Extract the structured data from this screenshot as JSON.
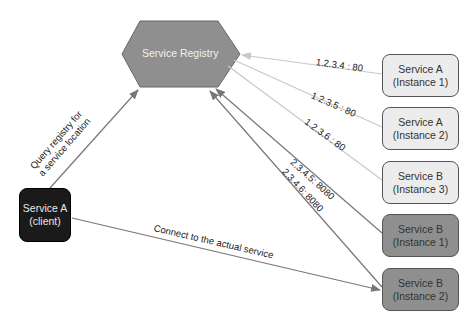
{
  "registry": {
    "label": "Service Registry",
    "fill": "#8f8f8f"
  },
  "client": {
    "line1": "Service A",
    "line2": "(client)"
  },
  "instances": [
    {
      "line1": "Service A",
      "line2": "(Instance 1)",
      "address": "1.2.3.4 : 80",
      "shade": "light"
    },
    {
      "line1": "Service A",
      "line2": "(Instance 2)",
      "address": "1.2.3.5 : 80",
      "shade": "light"
    },
    {
      "line1": "Service B",
      "line2": "(Instance 3)",
      "address": "1.2.3.6 : 80",
      "shade": "light"
    },
    {
      "line1": "Service B",
      "line2": "(Instance 1)",
      "address": "2.3.4.5: 8080",
      "shade": "dark"
    },
    {
      "line1": "Service B",
      "line2": "(Instance 2)",
      "address": "2.3.4.6: 8080",
      "shade": "dark"
    }
  ],
  "edges": {
    "query_line1": "Query registry for",
    "query_line2": "a service location",
    "connect": "Connect to the actual service"
  },
  "colors": {
    "light_line": "#c8c8c8",
    "dark_line": "#777777",
    "client_fill": "#1a1a1a",
    "dark_fill": "#8f8f8f",
    "light_fill": "#ececec"
  }
}
